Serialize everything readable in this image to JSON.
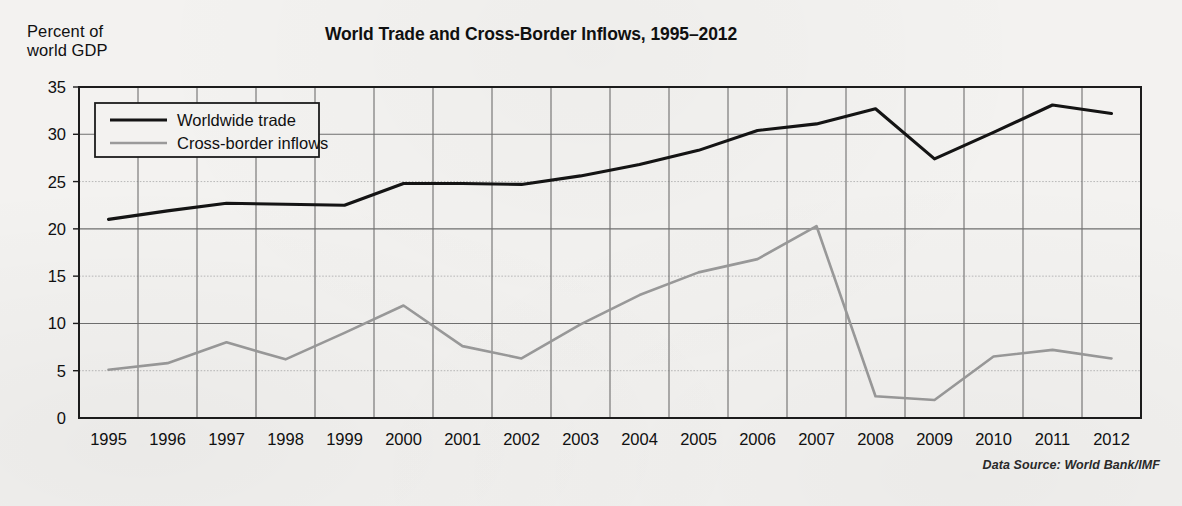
{
  "chart_data": {
    "type": "line",
    "title": "World Trade and Cross-Border Inflows, 1995–2012",
    "ylabel": "Percent of\nworld GDP",
    "xlabel": "",
    "source_note": "Data Source: World Bank/IMF",
    "ylim": [
      0,
      35
    ],
    "yticks": [
      0,
      5,
      10,
      15,
      20,
      25,
      30,
      35
    ],
    "ytick_labels": [
      "0",
      "5",
      "10",
      "15",
      "20",
      "25",
      "30",
      "35"
    ],
    "grid": true,
    "grid_major_values": [
      10,
      20,
      30
    ],
    "grid_minor_values": [
      5,
      15,
      25
    ],
    "legend_position": "upper-left-inside",
    "categories": [
      "1995",
      "1996",
      "1997",
      "1998",
      "1999",
      "2000",
      "2001",
      "2002",
      "2003",
      "2004",
      "2005",
      "2006",
      "2007",
      "2008",
      "2009",
      "2010",
      "2011",
      "2012"
    ],
    "x": [
      1995,
      1996,
      1997,
      1998,
      1999,
      2000,
      2001,
      2002,
      2003,
      2004,
      2005,
      2006,
      2007,
      2008,
      2009,
      2010,
      2011,
      2012
    ],
    "series": [
      {
        "name": "Worldwide trade",
        "color": "#141414",
        "width": 3.1,
        "values": [
          21.0,
          21.9,
          22.7,
          22.6,
          22.5,
          24.8,
          24.8,
          24.7,
          25.6,
          26.8,
          28.3,
          30.4,
          31.1,
          32.7,
          27.4,
          30.2,
          33.1,
          32.2
        ]
      },
      {
        "name": "Cross-border inflows",
        "color": "#9a9a9a",
        "width": 2.6,
        "values": [
          5.1,
          5.8,
          8.0,
          6.2,
          9.0,
          11.9,
          7.6,
          6.3,
          9.9,
          13.0,
          15.4,
          16.8,
          20.3,
          2.3,
          1.9,
          6.5,
          7.2,
          6.3
        ]
      }
    ]
  },
  "legend": {
    "items": [
      {
        "label": "Worldwide trade"
      },
      {
        "label": "Cross-border inflows"
      }
    ]
  },
  "axis": {
    "y_caption": "Percent of\nworld GDP"
  }
}
